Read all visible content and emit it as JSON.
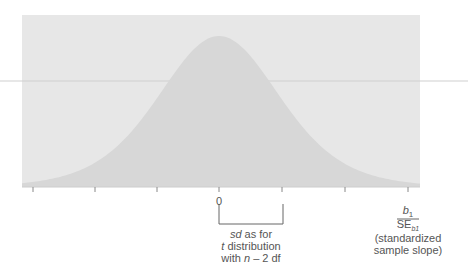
{
  "chart_data": {
    "type": "area",
    "title": "",
    "curve": "t-distribution density centered at 0",
    "x_ticks": [
      "",
      "",
      "",
      "0",
      "",
      "",
      "b1/SE_b1"
    ],
    "center_label": "0",
    "xlabel": {
      "numerator": "b",
      "numerator_sub": "1",
      "denominator": "SE",
      "denominator_sub": "b1",
      "caption_line1": "(standardized",
      "caption_line2": "sample slope)"
    },
    "annotation": {
      "line1_italic": "sd",
      "line1_rest": " as for",
      "line2_italic": "t",
      "line2_rest": " distribution",
      "line3_prefix": "with ",
      "line3_italic": "n",
      "line3_rest": " – 2 df"
    },
    "colors": {
      "panel": "#e6e6e6",
      "curve_fill": "#d6d6d6",
      "axis": "#999999",
      "rule_line": "#c8c8c8"
    },
    "grid": false,
    "legend": null
  }
}
